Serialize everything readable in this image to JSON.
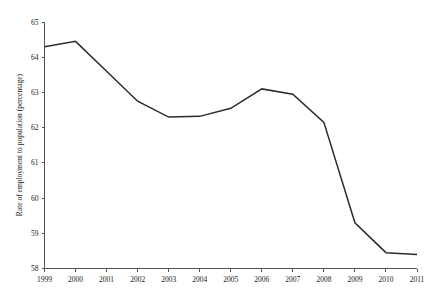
{
  "chart_data": {
    "type": "line",
    "title": "",
    "subtitle": "",
    "xlabel": "",
    "ylabel": "Rate of employment to population (percentage)",
    "categories": [
      "1999",
      "2000",
      "2001",
      "2002",
      "2003",
      "2004",
      "2005",
      "2006",
      "2007",
      "2008",
      "2009",
      "2010",
      "2011"
    ],
    "x": [
      1999,
      2000,
      2001,
      2002,
      2003,
      2004,
      2005,
      2006,
      2007,
      2008,
      2009,
      2010,
      2011
    ],
    "values": [
      64.3,
      64.45,
      63.6,
      62.75,
      62.3,
      62.32,
      62.55,
      63.1,
      62.95,
      62.15,
      59.3,
      58.45,
      58.4
    ],
    "series": [
      {
        "name": "Rate of employment to population (percentage)",
        "values": [
          64.3,
          64.45,
          63.6,
          62.75,
          62.3,
          62.32,
          62.55,
          63.1,
          62.95,
          62.15,
          59.3,
          58.45,
          58.4
        ]
      }
    ],
    "ylim": [
      58,
      65
    ],
    "xlim": [
      1999,
      2011
    ],
    "y_ticks": [
      58,
      59,
      60,
      61,
      62,
      63,
      64,
      65
    ],
    "y_tick_labels": [
      "58",
      "59",
      "60",
      "61",
      "62",
      "63",
      "64",
      "65"
    ],
    "x_ticks": [
      1999,
      2000,
      2001,
      2002,
      2003,
      2004,
      2005,
      2006,
      2007,
      2008,
      2009,
      2010,
      2011
    ],
    "x_tick_labels": [
      "1999",
      "2000",
      "2001",
      "2002",
      "2003",
      "2004",
      "2005",
      "2006",
      "2007",
      "2008",
      "2009",
      "2010",
      "2011"
    ],
    "grid": false,
    "legend": false,
    "legend_position": "none",
    "line_color": "#2b2b2b",
    "axis_color": "#555555",
    "background_color": "#ffffff",
    "annotations": []
  }
}
